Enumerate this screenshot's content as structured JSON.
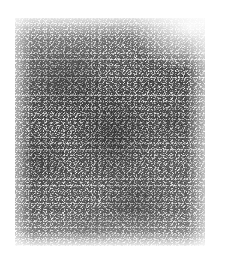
{
  "figure": {
    "kind": "grainy-autoradiograph-panel",
    "caption_top": "",
    "panel": {
      "x": 15,
      "y": 18,
      "width": 190,
      "height": 228,
      "background_color": "#ffffff",
      "grain_color": "#4a4a4a",
      "mean_tone": "#c8c8c8"
    },
    "regions": [
      {
        "name": "upper-left-dense-blob",
        "cx_pct": 26,
        "cy_pct": 26,
        "intensity": "dark"
      },
      {
        "name": "center-dense-blob",
        "cx_pct": 52,
        "cy_pct": 52,
        "intensity": "dark"
      },
      {
        "name": "lower-center-dense-blob",
        "cx_pct": 63,
        "cy_pct": 82,
        "intensity": "medium-dark"
      },
      {
        "name": "left-mid-blob",
        "cx_pct": 14,
        "cy_pct": 62,
        "intensity": "medium"
      },
      {
        "name": "right-mid-blob",
        "cx_pct": 83,
        "cy_pct": 46,
        "intensity": "medium"
      },
      {
        "name": "top-right-light-margin",
        "cx_pct": 92,
        "cy_pct": 4,
        "intensity": "light"
      },
      {
        "name": "bottom-light-margin",
        "cx_pct": 50,
        "cy_pct": 99,
        "intensity": "light"
      }
    ]
  },
  "colors": {
    "page_background": "#ffffff",
    "grain_dark": "#4a4a4a",
    "grain_light": "#fbfbfb",
    "caption_text": "#f3f3f3"
  }
}
